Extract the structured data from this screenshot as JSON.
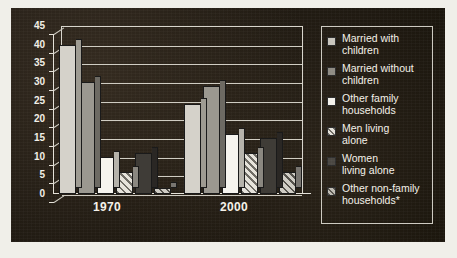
{
  "chart_data": {
    "type": "bar",
    "title": "",
    "subtitle": "",
    "xlabel": "",
    "ylabel": "",
    "categories": [
      "1970",
      "2000"
    ],
    "ylim": [
      0,
      45
    ],
    "yticks": [
      0,
      5,
      10,
      15,
      20,
      25,
      30,
      35,
      40,
      45
    ],
    "grid": true,
    "legend_position": "right",
    "series": [
      {
        "name": "Married with children",
        "values": [
          40,
          24
        ]
      },
      {
        "name": "Married without children",
        "values": [
          30,
          29
        ]
      },
      {
        "name": "Other family households",
        "values": [
          10,
          16
        ]
      },
      {
        "name": "Men living alone",
        "values": [
          6,
          11
        ]
      },
      {
        "name": "Women living alone",
        "values": [
          11,
          15
        ]
      },
      {
        "name": "Other non-family households*",
        "values": [
          1.5,
          6
        ]
      }
    ]
  },
  "axis": {
    "y_tick_labels": [
      "45",
      "40",
      "35",
      "30",
      "25",
      "20",
      "15",
      "10",
      "5",
      "0"
    ],
    "x_tick_labels": [
      "1970",
      "2000"
    ]
  },
  "legend": {
    "items": [
      {
        "label": "Married with\nchildren",
        "swatch": "light-gray-swatch",
        "color": "#c9c6be"
      },
      {
        "label": "Married without\nchildren",
        "swatch": "medium-gray-swatch",
        "color": "#8e8b83"
      },
      {
        "label": "Other family\nhouseholds",
        "swatch": "white-swatch",
        "color": "#f4f2ec"
      },
      {
        "label": "Men living\nalone",
        "swatch": "hatched-light-swatch",
        "color": "#e6e3db"
      },
      {
        "label": "Women\nliving alone",
        "swatch": "dark-gray-swatch",
        "color": "#4a4742"
      },
      {
        "label": "Other non-family\nhouseholds*",
        "swatch": "hatched-gray-swatch",
        "color": "#bfbcb4"
      }
    ]
  },
  "colors": {
    "panel_background": "#191510",
    "page_background": "#f0efe9",
    "axis": "#e4e1d8",
    "grid": "#cfccc2",
    "text": "#f4f1e9"
  }
}
